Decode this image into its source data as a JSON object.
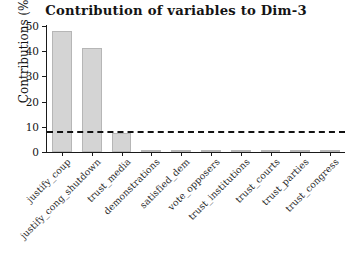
{
  "chart_data": {
    "type": "bar",
    "title": "Contribution of variables to Dim-3",
    "xlabel": "",
    "ylabel": "Contributions (%)",
    "categories": [
      "justify_coup",
      "justify_cong_shutdown",
      "trust_media",
      "demonstrations",
      "satisfied_dem",
      "vote_opposers",
      "trust_institutions",
      "trust_courts",
      "trust_parties",
      "trust_congress"
    ],
    "values": [
      48.0,
      41.3,
      7.7,
      0.8,
      0.6,
      0.5,
      0.45,
      0.4,
      0.35,
      0.3
    ],
    "ylim": [
      0,
      50
    ],
    "yticks": [
      0,
      10,
      20,
      30,
      40,
      50
    ],
    "ytick_labels": [
      "0",
      "10",
      "20",
      "30",
      "40",
      "50"
    ],
    "grid": false,
    "legend": null,
    "reference_line": {
      "value": 8.5,
      "style": "dashed",
      "color": "#111111",
      "label": "expected average contribution"
    },
    "bar_color": "#d4d4d4",
    "bar_border_color": "#b6b6b6",
    "axis_color": "#1a1a1a",
    "text_color": "#141414",
    "background": "#ffffff"
  }
}
